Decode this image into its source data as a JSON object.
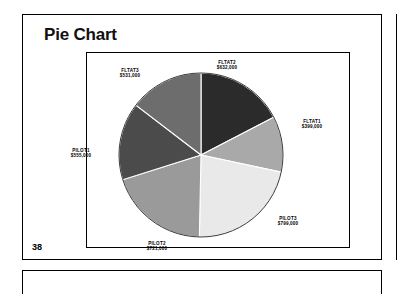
{
  "slide": {
    "title": "Pie Chart",
    "page_number": "38"
  },
  "chart_data": {
    "type": "pie",
    "title": "Pie Chart",
    "xlabel": "",
    "ylabel": "",
    "legend_position": "none",
    "grid": false,
    "labels_show_value": true,
    "total": 3637000,
    "categories": [
      "FLTAT2",
      "FLTAT1",
      "PILOT3",
      "PILOT2",
      "PILOT1",
      "FLTAT3"
    ],
    "values": [
      632000,
      399000,
      799000,
      721000,
      555000,
      531000
    ],
    "value_labels": [
      "$632,000",
      "$399,000",
      "$799,000",
      "$721,000",
      "$555,000",
      "$531,000"
    ],
    "colors": [
      "#2b2b2b",
      "#a9a9a9",
      "#e9e9e9",
      "#9a9a9a",
      "#4b4b4b",
      "#6d6d6d"
    ],
    "slices": [
      {
        "name": "FLTAT2",
        "value": 632000,
        "value_label": "$632,000",
        "color": "#2b2b2b"
      },
      {
        "name": "FLTAT1",
        "value": 399000,
        "value_label": "$399,000",
        "color": "#a9a9a9"
      },
      {
        "name": "PILOT3",
        "value": 799000,
        "value_label": "$799,000",
        "color": "#e9e9e9"
      },
      {
        "name": "PILOT2",
        "value": 721000,
        "value_label": "$721,000",
        "color": "#9a9a9a"
      },
      {
        "name": "PILOT1",
        "value": 555000,
        "value_label": "$555,000",
        "color": "#4b4b4b"
      },
      {
        "name": "FLTAT3",
        "value": 531000,
        "value_label": "$531,000",
        "color": "#6d6d6d"
      }
    ]
  }
}
